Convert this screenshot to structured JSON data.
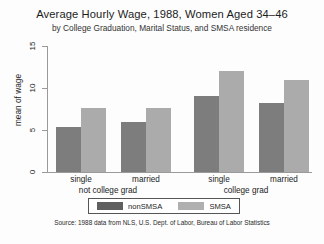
{
  "chart_data": {
    "type": "bar",
    "title": "Average Hourly Wage, 1988, Women Aged 34–46",
    "subtitle": "by College Graduation, Marital Status, and SMSA residence",
    "xlabel": "",
    "ylabel": "mean of wage",
    "ylim": [
      0,
      15
    ],
    "yticks": [
      0,
      5,
      10,
      15
    ],
    "ytick_labels": [
      "0",
      "5",
      "10",
      "15"
    ],
    "grid": false,
    "legend_position": "bottom-center",
    "categories": [
      "single",
      "married",
      "single",
      "married"
    ],
    "groups": [
      {
        "label": "not college grad",
        "categories": [
          "single",
          "married"
        ]
      },
      {
        "label": "college grad",
        "categories": [
          "single",
          "married"
        ]
      }
    ],
    "series": [
      {
        "name": "nonSMSA",
        "color": "#7d7d7d",
        "values": [
          5.3,
          5.9,
          9.0,
          8.2
        ]
      },
      {
        "name": "SMSA",
        "color": "#ababab",
        "values": [
          7.6,
          7.6,
          12.0,
          10.9
        ]
      }
    ],
    "source": "Source:  1988 data from NLS, U.S. Dept. of Labor, Bureau of Labor Statistics"
  },
  "legend": {
    "items": [
      {
        "label": "nonSMSA",
        "swatch": "dark"
      },
      {
        "label": "SMSA",
        "swatch": "light"
      }
    ]
  },
  "axis": {
    "y_label": "mean of wage",
    "tick_0": "0",
    "tick_5": "5",
    "tick_10": "10",
    "tick_15": "15"
  },
  "categories": {
    "g0_c0": "single",
    "g0_c1": "married",
    "g1_c0": "single",
    "g1_c1": "married",
    "group0": "not college grad",
    "group1": "college grad"
  }
}
